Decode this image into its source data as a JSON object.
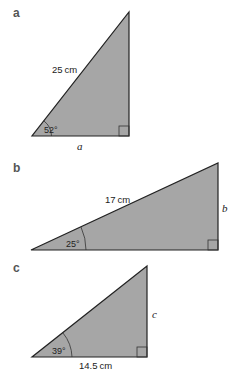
{
  "colors": {
    "fill": "#a6a6a6",
    "stroke": "#222222",
    "background": "#ffffff"
  },
  "triangles": [
    {
      "label": "a",
      "hypotenuse": "25 cm",
      "angle": "52°",
      "unknown": "a",
      "unknown_side": "adjacent (base)",
      "vertices": {
        "angle": [
          32,
          136
        ],
        "right": [
          129,
          136
        ],
        "apex": [
          129,
          12
        ]
      }
    },
    {
      "label": "b",
      "hypotenuse": "17 cm",
      "angle": "25°",
      "unknown": "b",
      "unknown_side": "opposite (vertical)",
      "vertices": {
        "angle": [
          31,
          250
        ],
        "right": [
          218,
          250
        ],
        "apex": [
          218,
          163
        ]
      }
    },
    {
      "label": "c",
      "adjacent": "14.5 cm",
      "angle": "39°",
      "unknown": "c",
      "unknown_side": "opposite (vertical)",
      "vertices": {
        "angle": [
          32,
          357
        ],
        "right": [
          147,
          357
        ],
        "apex": [
          147,
          266
        ]
      }
    }
  ]
}
